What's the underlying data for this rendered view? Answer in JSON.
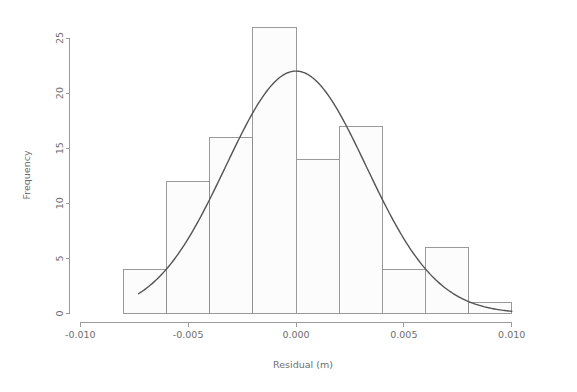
{
  "chart_data": {
    "type": "bar",
    "title": "",
    "subtitle": "",
    "xlabel": "Residual (m)",
    "ylabel": "Frequency",
    "xlim": [
      -0.0105,
      0.0105
    ],
    "ylim": [
      0,
      26.5
    ],
    "grid": false,
    "legend": null,
    "bin_width": 0.002,
    "bin_edges": [
      -0.008,
      -0.006,
      -0.004,
      -0.002,
      0.0,
      0.002,
      0.004,
      0.006,
      0.008,
      0.01
    ],
    "categories": [
      "-0.008 to -0.006",
      "-0.006 to -0.004",
      "-0.004 to -0.002",
      "-0.002 to 0.000",
      "0.000 to 0.002",
      "0.002 to 0.004",
      "0.004 to 0.006",
      "0.006 to 0.008",
      "0.008 to 0.010"
    ],
    "values": [
      4,
      12,
      16,
      26,
      14,
      17,
      4,
      6,
      1
    ],
    "bin_centers": [
      -0.007,
      -0.005,
      -0.003,
      -0.001,
      0.001,
      0.003,
      0.005,
      0.007,
      0.009
    ],
    "xticks": [
      -0.01,
      -0.005,
      0.0,
      0.005,
      0.01
    ],
    "xtick_labels": [
      "-0.010",
      "-0.005",
      "0.000",
      "0.005",
      "0.010"
    ],
    "yticks": [
      0,
      5,
      10,
      15,
      20,
      25
    ],
    "ytick_labels": [
      "0",
      "5",
      "10",
      "15",
      "20",
      "25"
    ],
    "overlay": {
      "type": "line",
      "name": "normal density curve",
      "peak_x": 0.0,
      "peak_y": 22,
      "mean": 0.0,
      "sd": 0.00326,
      "x_start": -0.0073,
      "x_end": 0.01,
      "x": [
        -0.0073,
        -0.0068,
        -0.0063,
        -0.0058,
        -0.0053,
        -0.0048,
        -0.0043,
        -0.0038,
        -0.0033,
        -0.0028,
        -0.0023,
        -0.0018,
        -0.0013,
        -0.0008,
        -0.0003,
        0.0002,
        0.0007,
        0.0012,
        0.0017,
        0.0022,
        0.0027,
        0.0032,
        0.0037,
        0.0042,
        0.0047,
        0.0052,
        0.0057,
        0.0062,
        0.0067,
        0.0072,
        0.0077,
        0.0082,
        0.0087,
        0.0092,
        0.0097,
        0.01
      ],
      "y": [
        1.6,
        2.2,
        3.0,
        4.0,
        5.2,
        6.6,
        8.2,
        9.9,
        11.8,
        13.7,
        15.6,
        17.4,
        19.0,
        20.4,
        21.5,
        21.9,
        21.6,
        20.8,
        19.5,
        17.9,
        16.0,
        14.0,
        12.0,
        10.0,
        8.2,
        6.5,
        5.0,
        3.8,
        2.8,
        2.0,
        1.4,
        0.9,
        0.6,
        0.4,
        0.3,
        0.25
      ]
    },
    "colors": {
      "bar_fill": "#fcfcfc",
      "bar_stroke": "#8f8f8f",
      "curve": "#555555",
      "axis": "#9a9a9a",
      "text": "#6e6e6e",
      "background": "#ffffff"
    }
  }
}
